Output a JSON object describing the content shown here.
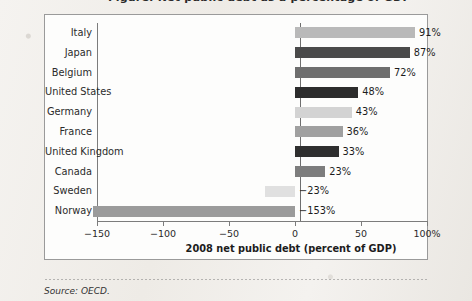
{
  "page": {
    "top_cropped_text": "Figure: Net public debt as a percentage of GDP",
    "source_note": "Source: OECD."
  },
  "chart_data": {
    "type": "bar",
    "orientation": "horizontal",
    "title": "",
    "xlabel": "2008 net public debt (percent of GDP)",
    "ylabel": "",
    "xlim": [
      -150,
      100
    ],
    "grid": false,
    "legend": false,
    "xticks": [
      -150,
      -100,
      -50,
      0,
      50,
      100
    ],
    "xtick_labels": [
      "−150",
      "−100",
      "−50",
      "0",
      "50",
      "100%"
    ],
    "categories": [
      "Italy",
      "Japan",
      "Belgium",
      "United States",
      "Germany",
      "France",
      "United Kingdom",
      "Canada",
      "Sweden",
      "Norway"
    ],
    "values": [
      91,
      87,
      72,
      48,
      43,
      36,
      33,
      23,
      -23,
      -153
    ],
    "value_labels": [
      "91%",
      "87%",
      "72%",
      "48%",
      "43%",
      "36%",
      "33%",
      "23%",
      "−23%",
      "−153%"
    ],
    "bar_colors": [
      "#b9b9b9",
      "#4a4a4a",
      "#6e6e6e",
      "#2c2c2c",
      "#d3d3d3",
      "#a0a0a0",
      "#2f2f2f",
      "#7d7d7d",
      "#e0e0e0",
      "#9b9b9b"
    ]
  },
  "axis": {
    "line_color": "#7c7c7c"
  }
}
